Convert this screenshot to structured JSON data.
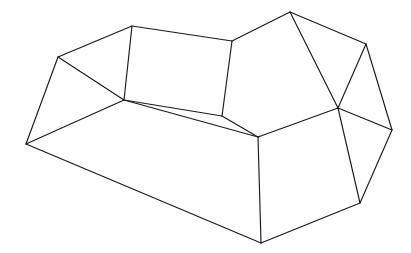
{
  "image": {
    "kind": "line-drawing",
    "subject": "3d-wireframe-polyhedron",
    "description": "Black outline wireframe drawing of an open box / sofa-like polyhedron shown in oblique perspective on a plain white background",
    "width": 411,
    "height": 253,
    "background_color": "#ffffff",
    "line_color": "#1a1a1a",
    "line_width": 1.15,
    "fill": "none"
  },
  "drawing": {
    "vertices": {
      "A": [
        26,
        144
      ],
      "B": [
        58,
        57
      ],
      "C": [
        132,
        26
      ],
      "D": [
        232,
        41
      ],
      "E": [
        290,
        12
      ],
      "F": [
        366,
        44
      ],
      "G": [
        392,
        130
      ],
      "H": [
        338,
        108
      ],
      "I": [
        360,
        203
      ],
      "J": [
        261,
        243
      ],
      "K": [
        124,
        100
      ],
      "L": [
        222,
        116
      ],
      "M": [
        258,
        137
      ]
    },
    "edges": [
      [
        "A",
        "B"
      ],
      [
        "B",
        "C"
      ],
      [
        "C",
        "D"
      ],
      [
        "D",
        "E"
      ],
      [
        "E",
        "F"
      ],
      [
        "F",
        "G"
      ],
      [
        "G",
        "H"
      ],
      [
        "G",
        "I"
      ],
      [
        "H",
        "I"
      ],
      [
        "I",
        "J"
      ],
      [
        "J",
        "A"
      ],
      [
        "J",
        "M"
      ],
      [
        "A",
        "K"
      ],
      [
        "B",
        "K"
      ],
      [
        "C",
        "K"
      ],
      [
        "K",
        "L"
      ],
      [
        "D",
        "L"
      ],
      [
        "L",
        "M"
      ],
      [
        "M",
        "H"
      ],
      [
        "E",
        "H"
      ],
      [
        "F",
        "H"
      ],
      [
        "K",
        "M"
      ]
    ],
    "polylines": {
      "outer_top_rim": [
        "A",
        "B",
        "C",
        "D",
        "E",
        "F",
        "G"
      ],
      "outer_bottom_rim": [
        "A",
        "J",
        "I",
        "G"
      ],
      "inner_rim": [
        "K",
        "L",
        "M",
        "H"
      ]
    }
  }
}
